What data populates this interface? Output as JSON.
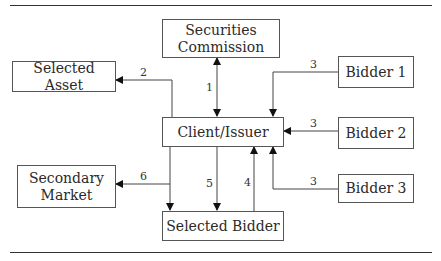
{
  "diagram": {
    "nodes": {
      "securities_commission": "Securities Commission",
      "selected_asset": "Selected Asset",
      "client_issuer": "Client/Issuer",
      "bidder_1": "Bidder 1",
      "bidder_2": "Bidder 2",
      "bidder_3": "Bidder 3",
      "secondary_market": "Secondary Market",
      "selected_bidder": "Selected Bidder"
    },
    "edge_labels": {
      "e1": "1",
      "e2": "2",
      "e3a": "3",
      "e3b": "3",
      "e3c": "3",
      "e4": "4",
      "e5": "5",
      "e6": "6"
    },
    "edges": [
      {
        "label": "1",
        "from": "Client/Issuer",
        "to": "Securities Commission",
        "bidirectional": true
      },
      {
        "label": "2",
        "from": "Client/Issuer",
        "to": "Selected Asset"
      },
      {
        "label": "3",
        "from": "Bidder 1",
        "to": "Client/Issuer"
      },
      {
        "label": "3",
        "from": "Bidder 2",
        "to": "Client/Issuer"
      },
      {
        "label": "3",
        "from": "Bidder 3",
        "to": "Client/Issuer"
      },
      {
        "label": "4",
        "from": "Selected Bidder",
        "to": "Client/Issuer"
      },
      {
        "label": "5",
        "from": "Client/Issuer",
        "to": "Selected Bidder"
      },
      {
        "label": "6",
        "from": "Client/Issuer",
        "to": "Secondary Market"
      }
    ]
  }
}
